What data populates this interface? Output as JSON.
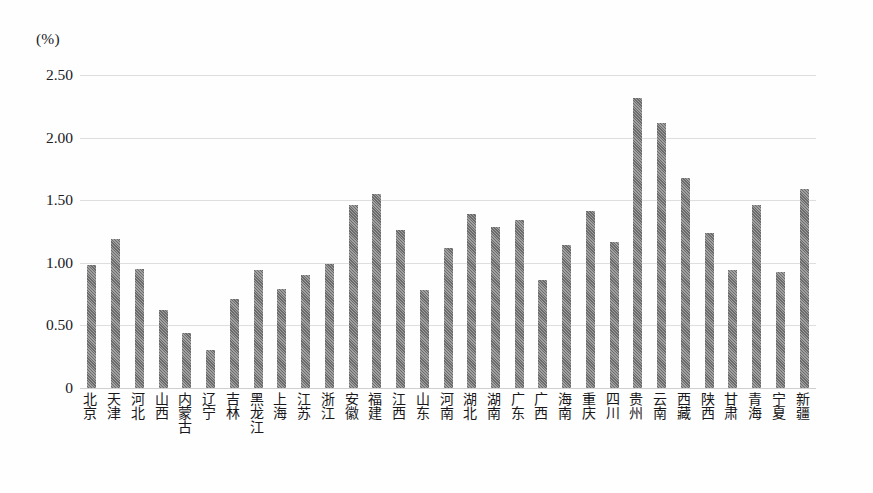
{
  "axis": {
    "unit_label": "(%)",
    "y_ticks": [
      "2.50",
      "2.00",
      "1.50",
      "1.00",
      "0.50",
      "0"
    ]
  },
  "chart_data": {
    "type": "bar",
    "title": "",
    "xlabel": "",
    "ylabel": "(%)",
    "ylim": [
      0,
      2.5
    ],
    "ytick_values": [
      2.5,
      2.0,
      1.5,
      1.0,
      0.5,
      0
    ],
    "ytick_labels": [
      "2.50",
      "2.00",
      "1.50",
      "1.00",
      "0.50",
      "0"
    ],
    "grid": true,
    "legend": "none",
    "bar_color": "#777777",
    "categories": [
      "北京",
      "天津",
      "河北",
      "山西",
      "内蒙古",
      "辽宁",
      "吉林",
      "黑龙江",
      "上海",
      "江苏",
      "浙江",
      "安徽",
      "福建",
      "江西",
      "山东",
      "河南",
      "湖北",
      "湖南",
      "广东",
      "广西",
      "海南",
      "重庆",
      "四川",
      "贵州",
      "云南",
      "西藏",
      "陕西",
      "甘肃",
      "青海",
      "宁夏",
      "新疆"
    ],
    "values": [
      0.98,
      1.19,
      0.95,
      0.62,
      0.44,
      0.3,
      0.71,
      0.94,
      0.79,
      0.9,
      0.99,
      1.46,
      1.55,
      1.26,
      0.78,
      1.12,
      1.39,
      1.29,
      1.34,
      0.86,
      1.14,
      1.41,
      1.17,
      2.32,
      2.12,
      1.68,
      1.24,
      0.94,
      1.46,
      0.93,
      1.59
    ]
  }
}
